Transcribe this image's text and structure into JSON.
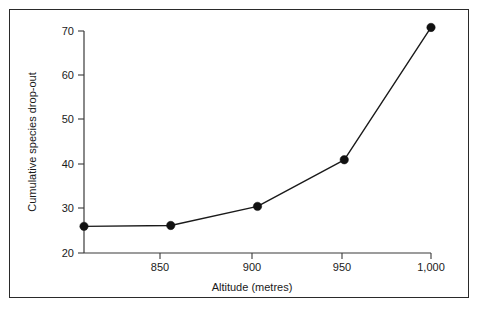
{
  "chart_data": {
    "type": "line",
    "title": "",
    "xlabel": "Altitude (metres)",
    "ylabel": "Cumulative species drop-out",
    "x": [
      800,
      850,
      900,
      950,
      1000
    ],
    "values": [
      26,
      26.2,
      30.5,
      41,
      70.8
    ],
    "series": [
      {
        "name": "Cumulative species drop-out",
        "values": [
          26,
          26.2,
          30.5,
          41,
          70.8
        ]
      }
    ],
    "xlim": [
      800,
      1000
    ],
    "ylim": [
      20,
      70
    ],
    "xticks": [
      850,
      900,
      950,
      1000
    ],
    "xtick_labels": [
      "850",
      "900",
      "950",
      "1,000"
    ],
    "yticks": [
      20,
      30,
      40,
      50,
      60,
      70
    ],
    "ytick_labels": [
      "20",
      "30",
      "40",
      "50",
      "60",
      "70"
    ],
    "grid": false,
    "legend": "none",
    "marker": "filled-circle",
    "line_color": "#1a1a1a",
    "marker_color": "#111111",
    "axis_color": "#3a3a3a",
    "background_color": "#ffffff",
    "border_color": "#2a2a2a"
  }
}
